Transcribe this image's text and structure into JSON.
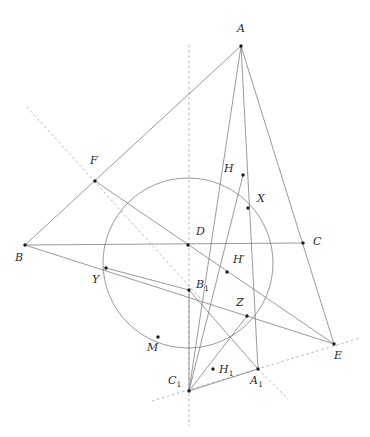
{
  "figure": {
    "width": 370,
    "height": 437,
    "background_color": "#ffffff",
    "stroke_color": "#6f6f6f",
    "dash_color": "#9a9a9a",
    "dot_color": "#1b1b1b",
    "circle": {
      "name": "nine-point-like-circle",
      "cx": 188,
      "cy": 263,
      "r": 85
    },
    "points": [
      {
        "id": "A",
        "label": "A",
        "sub": "",
        "prime": false,
        "x": 241,
        "y": 46,
        "lx": 237,
        "ly": 23,
        "dot": true
      },
      {
        "id": "B",
        "label": "B",
        "sub": "",
        "prime": false,
        "x": 25,
        "y": 245,
        "lx": 15,
        "ly": 252,
        "dot": true
      },
      {
        "id": "C",
        "label": "C",
        "sub": "",
        "prime": false,
        "x": 303,
        "y": 243,
        "lx": 313,
        "ly": 236,
        "dot": true
      },
      {
        "id": "D",
        "label": "D",
        "sub": "",
        "prime": false,
        "x": 188,
        "y": 245,
        "lx": 196,
        "ly": 226,
        "dot": true
      },
      {
        "id": "E",
        "label": "E",
        "sub": "",
        "prime": false,
        "x": 334,
        "y": 344,
        "lx": 334,
        "ly": 350,
        "dot": true
      },
      {
        "id": "F",
        "label": "F",
        "sub": "",
        "prime": false,
        "x": 95,
        "y": 181,
        "lx": 90,
        "ly": 155,
        "dot": true
      },
      {
        "id": "H",
        "label": "H",
        "sub": "",
        "prime": false,
        "x": 243,
        "y": 175,
        "lx": 224,
        "ly": 163,
        "dot": true
      },
      {
        "id": "X",
        "label": "X",
        "sub": "",
        "prime": false,
        "x": 248,
        "y": 208,
        "lx": 257,
        "ly": 193,
        "dot": true
      },
      {
        "id": "Hp",
        "label": "H",
        "sub": "",
        "prime": true,
        "x": 227,
        "y": 272,
        "lx": 233,
        "ly": 254,
        "dot": true
      },
      {
        "id": "Y",
        "label": "Y",
        "sub": "",
        "prime": false,
        "x": 106,
        "y": 268,
        "lx": 92,
        "ly": 274,
        "dot": true
      },
      {
        "id": "B1",
        "label": "B",
        "sub": "1",
        "prime": false,
        "x": 189,
        "y": 290,
        "lx": 196,
        "ly": 279,
        "dot": true
      },
      {
        "id": "Z",
        "label": "Z",
        "sub": "",
        "prime": false,
        "x": 247,
        "y": 316,
        "lx": 236,
        "ly": 297,
        "dot": true
      },
      {
        "id": "M",
        "label": "M",
        "sub": "",
        "prime": false,
        "x": 158,
        "y": 337,
        "lx": 147,
        "ly": 342,
        "dot": true
      },
      {
        "id": "C1",
        "label": "C",
        "sub": "1",
        "prime": false,
        "x": 189,
        "y": 391,
        "lx": 168,
        "ly": 375,
        "dot": true
      },
      {
        "id": "H1",
        "label": "H",
        "sub": "1",
        "prime": false,
        "x": 213,
        "y": 369,
        "lx": 219,
        "ly": 364,
        "dot": true
      },
      {
        "id": "A1",
        "label": "A",
        "sub": "1",
        "prime": false,
        "x": 258,
        "y": 369,
        "lx": 250,
        "ly": 375,
        "dot": true
      }
    ],
    "solid_segments": [
      {
        "name": "segment-A-B",
        "x1": 241,
        "y1": 46,
        "x2": 25,
        "y2": 245
      },
      {
        "name": "segment-B-C",
        "x1": 25,
        "y1": 245,
        "x2": 303,
        "y2": 243
      },
      {
        "name": "segment-A-E",
        "x1": 241,
        "y1": 46,
        "x2": 334,
        "y2": 344
      },
      {
        "name": "segment-B-E",
        "x1": 25,
        "y1": 245,
        "x2": 334,
        "y2": 344
      },
      {
        "name": "segment-F-E",
        "x1": 95,
        "y1": 181,
        "x2": 334,
        "y2": 344
      },
      {
        "name": "segment-A-C1",
        "x1": 241,
        "y1": 46,
        "x2": 189,
        "y2": 391
      },
      {
        "name": "segment-A-A1",
        "x1": 241,
        "y1": 46,
        "x2": 258,
        "y2": 369
      },
      {
        "name": "segment-B1-C1",
        "x1": 189,
        "y1": 290,
        "x2": 189,
        "y2": 391
      },
      {
        "name": "segment-B1-A1",
        "x1": 189,
        "y1": 290,
        "x2": 258,
        "y2": 369
      },
      {
        "name": "segment-C1-A1",
        "x1": 189,
        "y1": 391,
        "x2": 258,
        "y2": 369
      },
      {
        "name": "segment-C1-Z",
        "x1": 189,
        "y1": 391,
        "x2": 247,
        "y2": 316
      },
      {
        "name": "segment-Y-B1",
        "x1": 106,
        "y1": 268,
        "x2": 189,
        "y2": 290
      },
      {
        "name": "segment-H-C1",
        "x1": 243,
        "y1": 175,
        "x2": 189,
        "y2": 391
      }
    ],
    "dashed_segments": [
      {
        "name": "dashed-axis-vertical",
        "x1": 189,
        "y1": 45,
        "x2": 189,
        "y2": 426
      },
      {
        "name": "dashed-line-F-B1",
        "x1": 27,
        "y1": 107,
        "x2": 200,
        "y2": 298
      },
      {
        "name": "dashed-line-C1-A1-E",
        "x1": 152,
        "y1": 401,
        "x2": 360,
        "y2": 338
      },
      {
        "name": "dashed-line-A1-down-right",
        "x1": 258,
        "y1": 369,
        "x2": 288,
        "y2": 399
      }
    ],
    "arcs": [
      {
        "name": "arc-through-Z",
        "d": "M 152 348 Q 210 356 247 316"
      },
      {
        "name": "arc-H-X-Z-chord",
        "d": "M 243 175 Q 238 240 247 316"
      }
    ]
  }
}
